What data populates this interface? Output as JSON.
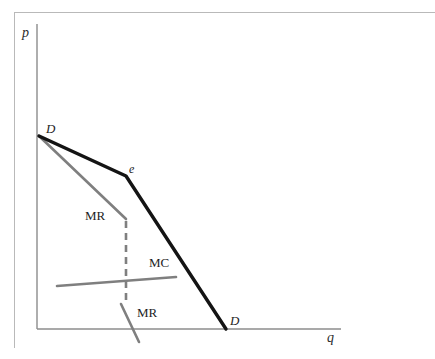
{
  "figure": {
    "background_color": "#ffffff",
    "frame_color": "#b9b9b9",
    "axis_color": "#8c8c8c"
  },
  "axes": {
    "y_label": "p",
    "x_label": "q",
    "y_axis_color": "#8c8c8c",
    "x_axis_color": "#8c8c8c"
  },
  "labels": {
    "demand_upper": "D",
    "kink_point": "e",
    "mr_upper": "MR",
    "mc": "MC",
    "mr_lower": "MR",
    "demand_lower": "D"
  },
  "colors": {
    "demand_curve": "#141414",
    "mr_curve": "#7f7f7f",
    "mc_curve": "#7f7f7f",
    "gap_dashed": "#7f7f7f"
  },
  "caption": "",
  "chart_data": {
    "type": "line",
    "xlabel": "q",
    "ylabel": "p",
    "xlim": [
      0,
      340
    ],
    "ylim": [
      0,
      329
    ],
    "grid": false,
    "legend": "none",
    "series": [
      {
        "name": "D",
        "label": "Demand curve (kinked)",
        "color": "#141414",
        "width": 3.4,
        "style": "solid",
        "points": [
          [
            39,
            136
          ],
          [
            126,
            176
          ],
          [
            226,
            329
          ]
        ]
      },
      {
        "name": "MR",
        "label": "Marginal revenue (upper segment)",
        "color": "#7f7f7f",
        "width": 2.6,
        "style": "solid",
        "points": [
          [
            39,
            136
          ],
          [
            126,
            219
          ]
        ]
      },
      {
        "name": "MR-gap",
        "label": "Marginal revenue discontinuity",
        "color": "#7f7f7f",
        "width": 2.6,
        "style": "dashed",
        "points": [
          [
            126,
            221
          ],
          [
            126,
            305
          ]
        ]
      },
      {
        "name": "MR",
        "label": "Marginal revenue (lower segment)",
        "color": "#7f7f7f",
        "width": 2.6,
        "style": "solid",
        "points": [
          [
            121,
            304
          ],
          [
            139,
            342
          ]
        ]
      },
      {
        "name": "MC",
        "label": "Marginal cost",
        "color": "#7f7f7f",
        "width": 2.6,
        "style": "solid",
        "points": [
          [
            57,
            286
          ],
          [
            176,
            277
          ]
        ]
      }
    ],
    "annotations": [
      {
        "text": "D",
        "x": 48,
        "y": 129,
        "note": "demand curve upper endpoint label"
      },
      {
        "text": "e",
        "x": 130,
        "y": 170,
        "note": "kink point label"
      },
      {
        "text": "MR",
        "x": 88,
        "y": 216,
        "note": "upper marginal revenue label"
      },
      {
        "text": "MC",
        "x": 152,
        "y": 263,
        "note": "marginal cost label"
      },
      {
        "text": "MR",
        "x": 140,
        "y": 313,
        "note": "lower marginal revenue label"
      },
      {
        "text": "D",
        "x": 232,
        "y": 322,
        "note": "demand curve lower endpoint label"
      }
    ]
  }
}
